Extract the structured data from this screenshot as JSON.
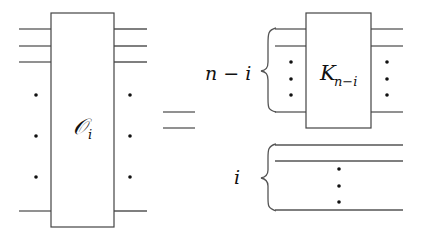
{
  "diagram": {
    "left_operator": {
      "label": "𝒪",
      "subscript": "i"
    },
    "equals": "=",
    "top_group": {
      "brace_label": "n − i",
      "operator": {
        "label": "K",
        "subscript": "n−i"
      }
    },
    "bottom_group": {
      "brace_label": "i"
    }
  }
}
